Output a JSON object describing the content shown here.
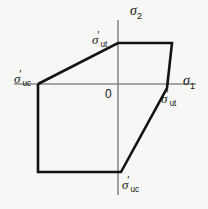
{
  "figure": {
    "type": "biaxial-failure-envelope-diagram",
    "background_color": "#f7f7f5",
    "line_color": "#131313",
    "axis_color": "#8a8a8a",
    "width": 208,
    "height": 209
  },
  "axes": {
    "horizontal": {
      "name": "sigma-1-axis",
      "label_symbol": "σ",
      "label_subscript": "1",
      "label_prime": "",
      "x_start": 14,
      "x_end": 196,
      "y": 84
    },
    "vertical": {
      "name": "sigma-2-axis",
      "label_symbol": "σ",
      "label_subscript": "2",
      "label_prime": "",
      "x": 118,
      "y_start": 20,
      "y_end": 195
    },
    "origin": {
      "label": "0",
      "x": 118,
      "y": 84
    }
  },
  "envelope": {
    "name": "failure-envelope-polygon",
    "closed": true,
    "points": [
      [
        38,
        84
      ],
      [
        118,
        43
      ],
      [
        172,
        43
      ],
      [
        167,
        88
      ],
      [
        121,
        172
      ],
      [
        38,
        172
      ]
    ],
    "points_svg": "38,84 118,43 172,43 167,88 121,172 38,172 38,84"
  },
  "vertex_labels": [
    {
      "name": "sigma-ut-prime-top-label",
      "symbol": "σ",
      "prime": "′",
      "subscript": "ut",
      "left": 92,
      "top": 30
    },
    {
      "name": "sigma-uc-prime-left-label",
      "symbol": "σ",
      "prime": "′",
      "subscript": "uc",
      "left": 14,
      "top": 69
    },
    {
      "name": "sigma-ut-prime-right-label",
      "symbol": "σ",
      "prime": "′",
      "subscript": "ut",
      "left": 161,
      "top": 89
    },
    {
      "name": "sigma-uc-prime-bottom-label",
      "symbol": "σ",
      "prime": "′",
      "subscript": "uc",
      "left": 122,
      "top": 175
    }
  ],
  "chart_data": {
    "type": "line",
    "title": "",
    "xlabel": "σ₁",
    "ylabel": "σ₂",
    "grid": false,
    "legend": "none",
    "series": [
      {
        "name": "failure-envelope",
        "x": [
          38,
          118,
          172,
          167,
          121,
          38,
          38
        ],
        "y": [
          84,
          43,
          43,
          88,
          172,
          172,
          84
        ]
      }
    ],
    "annotations": [
      {
        "text": "σ₂",
        "role": "vertical-axis-label"
      },
      {
        "text": "σ₁",
        "role": "horizontal-axis-label"
      },
      {
        "text": "0",
        "role": "origin"
      },
      {
        "text": "σ′ut",
        "role": "tensile-strength-sigma2-axis"
      },
      {
        "text": "σ′ut",
        "role": "tensile-strength-sigma1-axis"
      },
      {
        "text": "σ′uc",
        "role": "compressive-strength-sigma1-axis"
      },
      {
        "text": "σ′uc",
        "role": "compressive-strength-sigma2-axis"
      }
    ]
  }
}
